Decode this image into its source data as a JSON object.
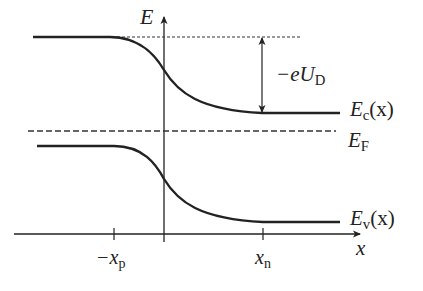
{
  "diagram": {
    "axes": {
      "y_label": "E",
      "x_label": "x",
      "ticks": [
        {
          "label_prefix": "−x",
          "label_sub": "p"
        },
        {
          "label_prefix": "x",
          "label_sub": "n"
        }
      ]
    },
    "labels": {
      "conduction_band": {
        "main": "E",
        "sub": "c",
        "suffix": "(x)"
      },
      "valence_band": {
        "main": "E",
        "sub": "v",
        "suffix": "(x)"
      },
      "fermi_level": {
        "main": "E",
        "sub": "F"
      },
      "barrier": {
        "prefix": "−eU",
        "sub": "D"
      }
    },
    "colors": {
      "line": "#222222",
      "background": "#ffffff"
    }
  }
}
